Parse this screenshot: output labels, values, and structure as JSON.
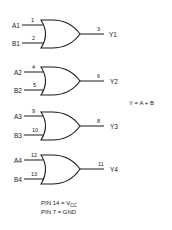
{
  "diagram": {
    "type": "logic-gate-diagram",
    "gate_type": "OR",
    "equation": "Y = A + B",
    "gates": [
      {
        "input_a": "A1",
        "input_b": "B1",
        "pin_a": "1",
        "pin_b": "2",
        "pin_out": "3",
        "output": "Y1"
      },
      {
        "input_a": "A2",
        "input_b": "B2",
        "pin_a": "4",
        "pin_b": "5",
        "pin_out": "6",
        "output": "Y2"
      },
      {
        "input_a": "A3",
        "input_b": "B3",
        "pin_a": "9",
        "pin_b": "10",
        "pin_out": "8",
        "output": "Y3"
      },
      {
        "input_a": "A4",
        "input_b": "B4",
        "pin_a": "12",
        "pin_b": "13",
        "pin_out": "11",
        "output": "Y4"
      }
    ],
    "power_notes": {
      "vcc_prefix": "PIN 14 = V",
      "vcc_sub": "CC",
      "gnd": "PIN 7 = GND"
    }
  }
}
